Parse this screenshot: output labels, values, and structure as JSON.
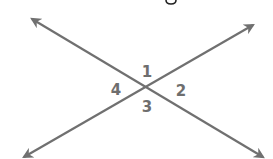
{
  "diagram": {
    "type": "intersecting-lines",
    "line_color": "#707070",
    "label_color": "#6e6e6e",
    "intersection": {
      "x": 147,
      "y": 88
    },
    "lines": [
      {
        "name": "line-a",
        "from": {
          "x": 32,
          "y": 19
        },
        "to": {
          "x": 263,
          "y": 157
        },
        "arrows": "both"
      },
      {
        "name": "line-b",
        "from": {
          "x": 253,
          "y": 25
        },
        "to": {
          "x": 24,
          "y": 157
        },
        "arrows": "both"
      }
    ],
    "angle_labels": [
      {
        "text": "1",
        "x": 147,
        "y": 72
      },
      {
        "text": "2",
        "x": 181,
        "y": 91
      },
      {
        "text": "3",
        "x": 147,
        "y": 107
      },
      {
        "text": "4",
        "x": 116,
        "y": 90
      }
    ]
  }
}
